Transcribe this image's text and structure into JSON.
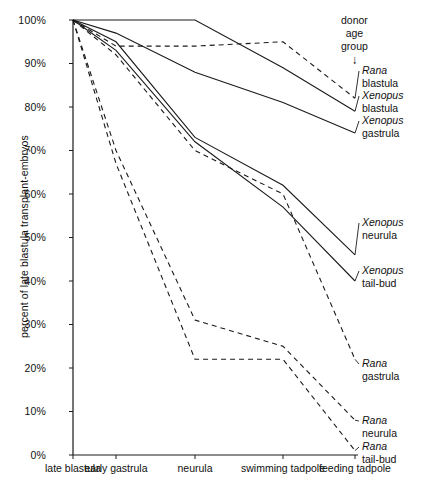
{
  "chart_data": {
    "type": "line",
    "title": "",
    "subtitle": "",
    "xlabel": "",
    "ylabel": "percent of late blastula transplant-embryos",
    "categories": [
      "late blastula",
      "early gastrula",
      "neurula",
      "swimming tadpole",
      "feeding tadpole"
    ],
    "ylim": [
      0,
      100
    ],
    "yticks": [
      "0%",
      "10%",
      "20%",
      "30%",
      "40%",
      "50%",
      "60%",
      "70%",
      "80%",
      "90%",
      "100%"
    ],
    "ytick_values": [
      0,
      10,
      20,
      30,
      40,
      50,
      60,
      70,
      80,
      90,
      100
    ],
    "grid": false,
    "legend_position": "right-inline-labels",
    "legend_title": "donor age group",
    "series": [
      {
        "name": "Rana blastula",
        "genus": "Rana",
        "stage": "blastula",
        "style": "dashed",
        "values": [
          100,
          94,
          94,
          95,
          82
        ],
        "label_x": 362,
        "label_y": 64
      },
      {
        "name": "Xenopus blastula",
        "genus": "Xenopus",
        "stage": "blastula",
        "style": "solid",
        "values": [
          100,
          100,
          100,
          89,
          79
        ],
        "label_x": 362,
        "label_y": 89
      },
      {
        "name": "Xenopus gastrula",
        "genus": "Xenopus",
        "stage": "gastrula",
        "style": "solid",
        "values": [
          100,
          97,
          88,
          81,
          74
        ],
        "label_x": 362,
        "label_y": 114
      },
      {
        "name": "Xenopus neurula",
        "genus": "Xenopus",
        "stage": "neurula",
        "style": "solid",
        "values": [
          100,
          95,
          73,
          62,
          46
        ],
        "label_x": 362,
        "label_y": 216
      },
      {
        "name": "Xenopus tail-bud",
        "genus": "Xenopus",
        "stage": "tail-bud",
        "style": "solid",
        "values": [
          100,
          93,
          72,
          57,
          40
        ],
        "label_x": 362,
        "label_y": 264
      },
      {
        "name": "Rana gastrula",
        "genus": "Rana",
        "stage": "gastrula",
        "style": "dashed",
        "values": [
          100,
          92,
          70,
          60,
          22
        ],
        "label_x": 362,
        "label_y": 357
      },
      {
        "name": "Rana neurula",
        "genus": "Rana",
        "stage": "neurula",
        "style": "dashed",
        "values": [
          100,
          70,
          31,
          25,
          8
        ],
        "label_x": 362,
        "label_y": 414
      },
      {
        "name": "Rana tail-bud",
        "genus": "Rana",
        "stage": "tail-bud",
        "style": "dashed",
        "values": [
          100,
          67,
          22,
          22,
          1
        ],
        "label_x": 362,
        "label_y": 440
      }
    ]
  },
  "axis": {
    "line_color": "#1a1a1a",
    "x_positions": [
      73,
      116,
      195,
      283,
      355
    ],
    "plot_left": 73,
    "plot_right": 355,
    "plot_top": 20,
    "plot_bottom": 455
  },
  "legend": {
    "title_lines": [
      "donor",
      "age",
      "group"
    ],
    "arrow_glyph": "↓"
  }
}
